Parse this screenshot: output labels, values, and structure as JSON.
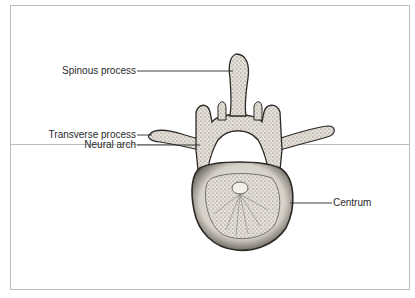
{
  "figure": {
    "labels": {
      "spinous_process": "Spinous process",
      "transverse_process": "Transverse process",
      "neural_arch": "Neural arch",
      "centrum": "Centrum"
    },
    "colors": {
      "frame": "#bdbdbd",
      "ink": "#2a2a2a",
      "bone_fill": "#e9e6e0",
      "bone_shade": "#5a5550",
      "background": "#ffffff"
    }
  }
}
